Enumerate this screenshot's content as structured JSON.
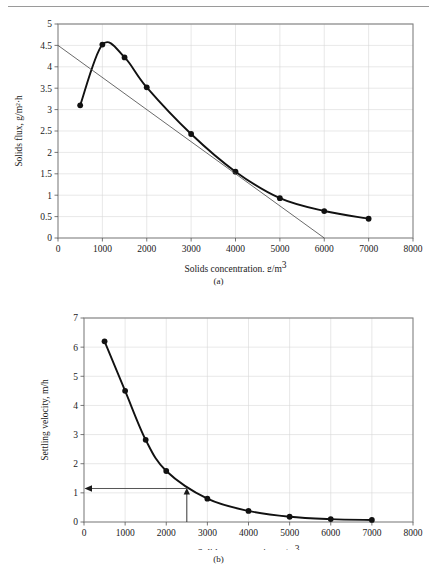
{
  "page": {
    "header_rule": true
  },
  "figures": [
    {
      "id": "a",
      "caption": "(a)",
      "xlabel_main": "Solids concentration, g/m",
      "xlabel_sup": "3",
      "ylabel": "Solids flux, g/m²·h"
    },
    {
      "id": "b",
      "caption": "(b)",
      "xlabel_main": "Solids concentration, g/m",
      "xlabel_sup": "3",
      "ylabel": "Settling velocity, m/h"
    }
  ],
  "chart_data": [
    {
      "type": "line",
      "id": "solids-flux-curve",
      "title": "",
      "xlabel": "Solids concentration, g/m3",
      "ylabel": "Solids flux, g/m2·h",
      "xlim": [
        0,
        8000
      ],
      "ylim": [
        0,
        5
      ],
      "xticks": [
        0,
        1000,
        2000,
        3000,
        4000,
        5000,
        6000,
        7000,
        8000
      ],
      "yticks": [
        0,
        0.5,
        1,
        1.5,
        2,
        2.5,
        3,
        3.5,
        4,
        4.5,
        5
      ],
      "xticklabels": [
        "0",
        "1000",
        "2000",
        "3000",
        "4000",
        "5000",
        "6000",
        "7000",
        "8000"
      ],
      "yticklabels": [
        "0",
        "0.5",
        "1",
        "1.5",
        "2",
        "2.5",
        "3",
        "3.5",
        "4",
        "4.5",
        "5"
      ],
      "grid": true,
      "legend": false,
      "series": [
        {
          "name": "Solids flux",
          "marker": "filled-circle",
          "x": [
            500,
            1000,
            1500,
            2000,
            3000,
            4000,
            5000,
            6000,
            7000
          ],
          "values": [
            3.1,
            4.52,
            4.22,
            3.52,
            2.43,
            1.55,
            0.93,
            0.63,
            0.45
          ]
        },
        {
          "name": "Tangent line",
          "marker": "none",
          "x": [
            0,
            6000
          ],
          "values": [
            4.5,
            0
          ]
        }
      ]
    },
    {
      "type": "line",
      "id": "settling-velocity-curve",
      "title": "",
      "xlabel": "Solids concentration, g/m3",
      "ylabel": "Settling velocity, m/h",
      "xlim": [
        0,
        8000
      ],
      "ylim": [
        0,
        7
      ],
      "xticks": [
        0,
        1000,
        2000,
        3000,
        4000,
        5000,
        6000,
        7000,
        8000
      ],
      "yticks": [
        0,
        1,
        2,
        3,
        4,
        5,
        6,
        7
      ],
      "xticklabels": [
        "0",
        "1000",
        "2000",
        "3000",
        "4000",
        "5000",
        "6000",
        "7000",
        "8000"
      ],
      "yticklabels": [
        "0",
        "1",
        "2",
        "3",
        "4",
        "5",
        "6",
        "7"
      ],
      "grid": true,
      "legend": false,
      "series": [
        {
          "name": "Settling velocity",
          "marker": "filled-circle",
          "x": [
            500,
            1000,
            1500,
            2000,
            3000,
            4000,
            5000,
            6000,
            7000
          ],
          "values": [
            6.2,
            4.5,
            2.82,
            1.75,
            0.8,
            0.38,
            0.18,
            0.1,
            0.07
          ]
        }
      ],
      "annotations": [
        {
          "name": "read-off-lines",
          "vertical_from": {
            "x": 2500,
            "y": 0
          },
          "vertical_to": {
            "x": 2500,
            "y": 1.15
          },
          "horizontal_from": {
            "x": 2500,
            "y": 1.15
          },
          "horizontal_to": {
            "x": 0,
            "y": 1.15
          },
          "arrow_heads": [
            "up-at-curve",
            "left-at-axis"
          ]
        }
      ]
    }
  ]
}
